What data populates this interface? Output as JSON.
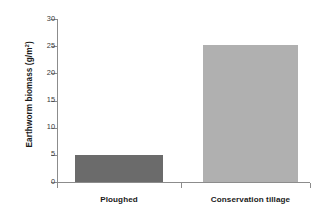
{
  "chart_data": {
    "type": "bar",
    "title": "",
    "xlabel": "",
    "ylabel": "Earthworm biomass (g/m²)",
    "ylabel_base": "Earthworm biomass (g/m",
    "ylabel_sup": "2",
    "ylabel_tail": ")",
    "categories": [
      "Ploughed",
      "Conservation tillage"
    ],
    "values": [
      5.0,
      25.3
    ],
    "ylim": [
      0,
      30
    ],
    "yticks": [
      0,
      5,
      10,
      15,
      20,
      25,
      30
    ],
    "ytick_labels": [
      "0",
      "5",
      "10",
      "15",
      "20",
      "25",
      "30"
    ],
    "grid": false,
    "legend": false,
    "bar_colors": [
      "#6b6b6b",
      "#b0b0b0"
    ],
    "axis_color": "#8c8c8c",
    "background": "#ffffff"
  }
}
